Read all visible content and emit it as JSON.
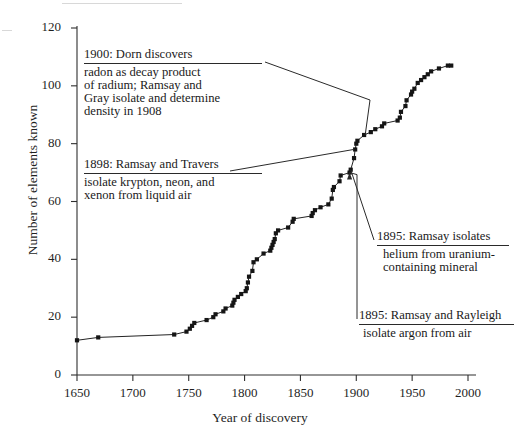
{
  "chart_data": {
    "type": "line",
    "title": "",
    "xlabel": "Year of discovery",
    "ylabel": "Number of elements known",
    "xlim": [
      1650,
      2000
    ],
    "ylim": [
      0,
      120
    ],
    "xticks": [
      1650,
      1700,
      1750,
      1800,
      1850,
      1900,
      1950,
      2000
    ],
    "yticks": [
      0,
      20,
      40,
      60,
      80,
      100,
      120
    ],
    "grid": false,
    "legend_position": "none",
    "marker": "filled-square",
    "series": [
      {
        "name": "Cumulative elements known",
        "points": [
          [
            1650,
            12
          ],
          [
            1669,
            13
          ],
          [
            1737,
            14
          ],
          [
            1748,
            15
          ],
          [
            1751,
            16
          ],
          [
            1753,
            17
          ],
          [
            1755,
            18
          ],
          [
            1766,
            19
          ],
          [
            1772,
            20
          ],
          [
            1774,
            21
          ],
          [
            1781,
            22
          ],
          [
            1783,
            23
          ],
          [
            1789,
            24
          ],
          [
            1790,
            25
          ],
          [
            1791,
            26
          ],
          [
            1794,
            27
          ],
          [
            1797,
            28
          ],
          [
            1801,
            29
          ],
          [
            1802,
            30
          ],
          [
            1803,
            32
          ],
          [
            1804,
            34
          ],
          [
            1807,
            36
          ],
          [
            1808,
            39
          ],
          [
            1811,
            40
          ],
          [
            1817,
            42
          ],
          [
            1823,
            43
          ],
          [
            1824,
            44
          ],
          [
            1825,
            45
          ],
          [
            1826,
            46
          ],
          [
            1827,
            47
          ],
          [
            1828,
            49
          ],
          [
            1830,
            50
          ],
          [
            1839,
            51
          ],
          [
            1843,
            53
          ],
          [
            1844,
            54
          ],
          [
            1860,
            55
          ],
          [
            1861,
            56
          ],
          [
            1863,
            57
          ],
          [
            1868,
            58
          ],
          [
            1875,
            59
          ],
          [
            1878,
            61
          ],
          [
            1879,
            64
          ],
          [
            1880,
            65
          ],
          [
            1885,
            67
          ],
          [
            1886,
            69
          ],
          [
            1894,
            70
          ],
          [
            1895,
            71
          ],
          [
            1898,
            75
          ],
          [
            1899,
            78
          ],
          [
            1900,
            80
          ],
          [
            1901,
            81
          ],
          [
            1907,
            83
          ],
          [
            1913,
            84
          ],
          [
            1917,
            85
          ],
          [
            1923,
            86
          ],
          [
            1925,
            87
          ],
          [
            1937,
            88
          ],
          [
            1939,
            89
          ],
          [
            1940,
            91
          ],
          [
            1944,
            93
          ],
          [
            1945,
            95
          ],
          [
            1949,
            97
          ],
          [
            1950,
            98
          ],
          [
            1952,
            99
          ],
          [
            1955,
            101
          ],
          [
            1958,
            102
          ],
          [
            1961,
            103
          ],
          [
            1964,
            104
          ],
          [
            1967,
            105
          ],
          [
            1974,
            106
          ],
          [
            1982,
            107
          ],
          [
            1985,
            107
          ]
        ]
      }
    ],
    "annotations": [
      {
        "id": "dorn",
        "heading": "1900: Dorn discovers",
        "body": "radon as decay product\nof  radium; Ramsay and\nGray isolate  and determine\ndensity in 1908",
        "points_to_year": 1908,
        "points_to_value": 83
      },
      {
        "id": "travers",
        "heading": "1898: Ramsay and Travers",
        "body": "isolate krypton,  neon, and\nxenon  from liquid air",
        "points_to_year": 1898,
        "points_to_value": 78
      },
      {
        "id": "helium",
        "heading": "1895: Ramsay isolates",
        "body": "helium from uranium-\ncontaining mineral",
        "points_to_year": 1895,
        "points_to_value": 71
      },
      {
        "id": "argon",
        "heading": "1895: Ramsay and Rayleigh",
        "body": "isolate argon from air",
        "points_to_year": 1894,
        "points_to_value": 70
      }
    ]
  }
}
